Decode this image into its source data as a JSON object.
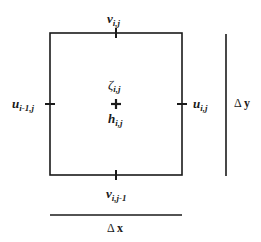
{
  "diagram": {
    "title": "",
    "cell": {
      "top_label": {
        "base": "v",
        "sub": "i,j"
      },
      "bottom_label": {
        "base": "v",
        "sub": "i,j-1"
      },
      "left_label": {
        "base": "u",
        "sub": "i-1,j"
      },
      "right_label": {
        "base": "u",
        "sub": "i,j"
      },
      "center_upper_label": {
        "base": "ζ",
        "sub": "i,j"
      },
      "center_lower_label": {
        "base": "h",
        "sub": "i,j"
      }
    },
    "dimensions": {
      "dx_label": {
        "sym": "Δ",
        "var": "x"
      },
      "dy_label": {
        "sym": "Δ",
        "var": "y"
      }
    },
    "colors": {
      "stroke": "#1a1a1a",
      "background": "#ffffff"
    }
  }
}
